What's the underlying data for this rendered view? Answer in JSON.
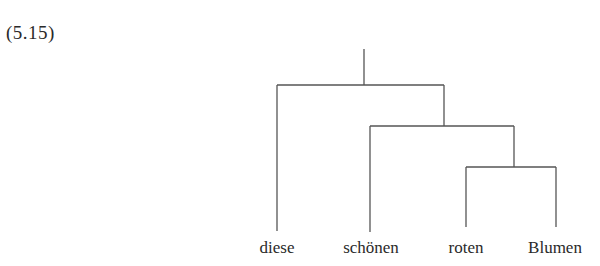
{
  "example_number": "(5.15)",
  "tree": {
    "type": "binary-branching constituency tree",
    "leaves": [
      {
        "label": "diese",
        "x": 277
      },
      {
        "label": "schönen",
        "x": 370
      },
      {
        "label": "roten",
        "x": 466
      },
      {
        "label": "Blumen",
        "x": 556
      }
    ],
    "structure": "[diese [schönen [roten Blumen]]]",
    "line_color": "#555555"
  }
}
